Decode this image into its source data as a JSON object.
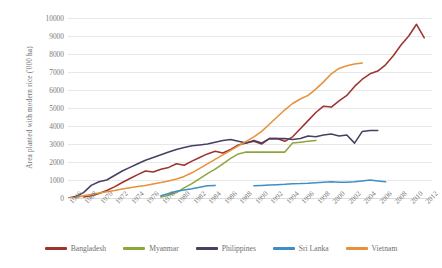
{
  "chart_data": {
    "type": "line",
    "title": "",
    "xlabel": "",
    "ylabel": "Area planted with modern rice ('000 ha)",
    "ylim": [
      0,
      10000
    ],
    "ytick_step": 1000,
    "ytick_labels": [
      "0",
      "1000",
      "2000",
      "3000",
      "4000",
      "5000",
      "6000",
      "7000",
      "8000",
      "9000",
      "10000"
    ],
    "xlim": [
      1966,
      2013
    ],
    "xtick_step": 2,
    "xtick_labels": [
      "1966",
      "1968",
      "1970",
      "1972",
      "1974",
      "1976",
      "1978",
      "1980",
      "1982",
      "1984",
      "1986",
      "1988",
      "1990",
      "1992",
      "1994",
      "1996",
      "1998",
      "2000",
      "2002",
      "2004",
      "2006",
      "2008",
      "2010",
      "2012"
    ],
    "grid": true,
    "legend_position": "bottom",
    "series": [
      {
        "name": "Bangladesh",
        "color": "#9E3430",
        "x": [
          1968,
          1969,
          1970,
          1971,
          1972,
          1973,
          1974,
          1975,
          1976,
          1977,
          1978,
          1979,
          1980,
          1981,
          1982,
          1983,
          1984,
          1985,
          1986,
          1987,
          1988,
          1989,
          1990,
          1991,
          1992,
          1993,
          1994,
          1995,
          1996,
          1997,
          1998,
          1999,
          2000,
          2001,
          2002,
          2003,
          2004,
          2005,
          2006,
          2007,
          2008,
          2009,
          2010,
          2011,
          2012
        ],
        "values": [
          60,
          130,
          250,
          420,
          620,
          860,
          1080,
          1300,
          1500,
          1450,
          1600,
          1700,
          1900,
          1820,
          2050,
          2250,
          2450,
          2600,
          2500,
          2700,
          2950,
          3050,
          3150,
          3000,
          3300,
          3300,
          3150,
          3400,
          3850,
          4300,
          4750,
          5100,
          5050,
          5400,
          5700,
          6200,
          6600,
          6900,
          7050,
          7400,
          7900,
          8500,
          9000,
          9650,
          8900
        ]
      },
      {
        "name": "Myanmar",
        "color": "#8FA63F",
        "x": [
          1978,
          1979,
          1980,
          1981,
          1982,
          1983,
          1984,
          1985,
          1986,
          1987,
          1988,
          1989,
          1990,
          1991,
          1992,
          1993,
          1994,
          1995,
          1996,
          1997,
          1998
        ],
        "values": [
          50,
          150,
          300,
          560,
          800,
          1080,
          1350,
          1600,
          1900,
          2200,
          2450,
          2550,
          2550,
          2550,
          2550,
          2550,
          2550,
          3050,
          3100,
          3150,
          3200
        ]
      },
      {
        "name": "Philippines",
        "color": "#4A3F63",
        "x": [
          1966,
          1967,
          1968,
          1969,
          1970,
          1971,
          1972,
          1973,
          1974,
          1975,
          1976,
          1977,
          1978,
          1979,
          1980,
          1981,
          1982,
          1983,
          1984,
          1985,
          1986,
          1987,
          1988,
          1989,
          1990,
          1991,
          1992,
          1993,
          1994,
          1995,
          1996,
          1997,
          1998,
          1999,
          2000,
          2001,
          2002,
          2003,
          2004,
          2005,
          2006
        ],
        "values": [
          0,
          80,
          300,
          700,
          900,
          1000,
          1250,
          1500,
          1700,
          1900,
          2100,
          2250,
          2400,
          2550,
          2700,
          2800,
          2900,
          2950,
          3000,
          3100,
          3200,
          3250,
          3150,
          3050,
          3200,
          3050,
          3300,
          3300,
          3300,
          3250,
          3300,
          3450,
          3400,
          3500,
          3550,
          3450,
          3500,
          3050,
          3700,
          3750,
          3750
        ]
      },
      {
        "name": "Sri Lanka",
        "color": "#3E8FC4",
        "x": [
          1978,
          1979,
          1980,
          1981,
          1982,
          1983,
          1984,
          1985,
          null,
          1990,
          1991,
          1992,
          1993,
          1994,
          1995,
          1996,
          1997,
          1998,
          1999,
          2000,
          2001,
          2002,
          2003,
          2004,
          2005,
          2006,
          2007
        ],
        "values": [
          120,
          250,
          380,
          450,
          520,
          600,
          680,
          700,
          null,
          680,
          700,
          720,
          740,
          760,
          790,
          800,
          820,
          850,
          880,
          900,
          880,
          870,
          900,
          950,
          1000,
          950,
          900
        ]
      },
      {
        "name": "Vietnam",
        "color": "#E8913A",
        "x": [
          1966,
          1967,
          1968,
          1969,
          1970,
          1971,
          1972,
          1973,
          1974,
          1975,
          1976,
          1977,
          1978,
          1979,
          1980,
          1981,
          1982,
          1983,
          1984,
          1985,
          1986,
          1987,
          1988,
          1989,
          1990,
          1991,
          1992,
          1993,
          1994,
          1995,
          1996,
          1997,
          1998,
          1999,
          2000,
          2001,
          2002,
          2003,
          2004
        ],
        "values": [
          0,
          30,
          120,
          200,
          280,
          350,
          420,
          500,
          570,
          640,
          700,
          780,
          860,
          950,
          1050,
          1200,
          1400,
          1650,
          1900,
          2150,
          2400,
          2650,
          2900,
          3150,
          3400,
          3700,
          4100,
          4500,
          4900,
          5250,
          5500,
          5700,
          6050,
          6450,
          6900,
          7200,
          7350,
          7450,
          7500
        ]
      }
    ]
  },
  "legend": {
    "items": [
      {
        "label": "Bangladesh"
      },
      {
        "label": "Myanmar"
      },
      {
        "label": "Philippines"
      },
      {
        "label": "Sri Lanka"
      },
      {
        "label": "Vietnam"
      }
    ]
  }
}
